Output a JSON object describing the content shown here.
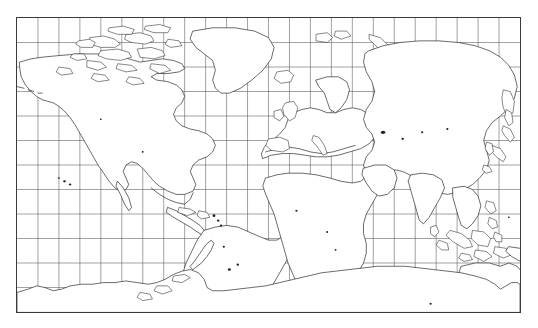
{
  "figure": {
    "kind": "world-map",
    "projection": "equirectangular",
    "title": "",
    "background_color": "#ffffff",
    "frame_color": "#3a3a3a",
    "graticule_color": "#555555",
    "coastline_color": "#111111",
    "land_fill": "#ffffff"
  },
  "map": {
    "frame": {
      "left_px": 16,
      "top_px": 17,
      "width_px": 505,
      "height_px": 296
    },
    "extent": {
      "lon_min": -190,
      "lon_max": 170,
      "lat_min": -90,
      "lat_max": 90
    },
    "graticule": {
      "enabled": true,
      "lon_step_deg": 15,
      "lat_step_deg": 15,
      "meridian_count": 23,
      "parallel_count": 11,
      "meridian_labels": [
        "-180",
        "-165",
        "-150",
        "-135",
        "-120",
        "-105",
        "-90",
        "-75",
        "-60",
        "-45",
        "-30",
        "-15",
        "0",
        "15",
        "30",
        "45",
        "60",
        "75",
        "90",
        "105",
        "120",
        "135",
        "150"
      ],
      "parallel_labels": [
        "75",
        "60",
        "45",
        "30",
        "15",
        "0",
        "-15",
        "-30",
        "-45",
        "-60",
        "-75"
      ]
    },
    "features": [
      {
        "name": "north-america",
        "type": "continent"
      },
      {
        "name": "greenland",
        "type": "island"
      },
      {
        "name": "canadian-arctic-archipelago",
        "type": "archipelago"
      },
      {
        "name": "south-america",
        "type": "continent"
      },
      {
        "name": "africa",
        "type": "continent"
      },
      {
        "name": "madagascar",
        "type": "island"
      },
      {
        "name": "europe",
        "type": "continent"
      },
      {
        "name": "asia",
        "type": "continent"
      },
      {
        "name": "japan",
        "type": "archipelago"
      },
      {
        "name": "indonesia",
        "type": "archipelago"
      },
      {
        "name": "philippines",
        "type": "archipelago"
      },
      {
        "name": "new-guinea",
        "type": "island"
      },
      {
        "name": "australia",
        "type": "continent"
      },
      {
        "name": "new-zealand",
        "type": "archipelago"
      },
      {
        "name": "antarctica",
        "type": "continent"
      },
      {
        "name": "iceland",
        "type": "island"
      },
      {
        "name": "british-isles",
        "type": "archipelago"
      },
      {
        "name": "svalbard",
        "type": "archipelago"
      },
      {
        "name": "caribbean-islands",
        "type": "archipelago"
      },
      {
        "name": "sri-lanka",
        "type": "island"
      },
      {
        "name": "hawaii",
        "type": "archipelago"
      }
    ]
  }
}
